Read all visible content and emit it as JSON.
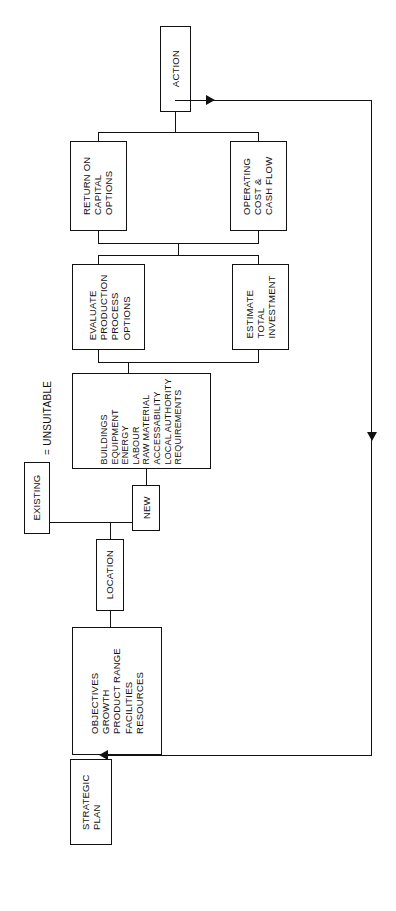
{
  "diagram": {
    "orientation": "rotated-90-ccw",
    "line_color": "#111111",
    "background": "#ffffff",
    "nodes": [
      {
        "id": "action",
        "label": "ACTION"
      },
      {
        "id": "return",
        "label": "RETURN ON\nCAPITAL\nOPTIONS"
      },
      {
        "id": "operating",
        "label": "OPERATING\nCOST &\nCASH FLOW"
      },
      {
        "id": "evaluate",
        "label": "EVALUATE\nPRODUCTION\nPROCESS\nOPTIONS"
      },
      {
        "id": "estimate",
        "label": "ESTIMATE\nTOTAL\nINVESTMENT"
      },
      {
        "id": "factors",
        "label": "BUILDINGS\nEQUIPMENT\nENERGY\nLABOUR\nRAW MATERIAL\nACCESSABILITY\nLOCAL AUTHORITY\nREQUIREMENTS"
      },
      {
        "id": "new",
        "label": "NEW"
      },
      {
        "id": "existing",
        "label": "EXISTING"
      },
      {
        "id": "location",
        "label": "LOCATION"
      },
      {
        "id": "objectives",
        "label": "OBJECTIVES\nGROWTH\nPRODUCT RANGE\nFACILITIES\nRESOURCES"
      },
      {
        "id": "strategic",
        "label": "STRATEGIC\nPLAN"
      }
    ],
    "legend": {
      "equals": "=",
      "text": "UNSUITABLE",
      "swatch_label": "EXISTING"
    },
    "labels": {
      "action": "ACTION",
      "return": "RETURN ON\nCAPITAL\nOPTIONS",
      "operating": "OPERATING\nCOST &\nCASH FLOW",
      "evaluate": "EVALUATE\nPRODUCTION\nPROCESS\nOPTIONS",
      "estimate": "ESTIMATE\nTOTAL\nINVESTMENT",
      "factors": "BUILDINGS\nEQUIPMENT\nENERGY\nLABOUR\nRAW MATERIAL\nACCESSABILITY\nLOCAL AUTHORITY\nREQUIREMENTS",
      "new": "NEW",
      "existing": "EXISTING",
      "location": "LOCATION",
      "objectives": "OBJECTIVES\nGROWTH\nPRODUCT RANGE\nFACILITIES\nRESOURCES",
      "strategic": "STRATEGIC\nPLAN",
      "legend_unsuitable": "= UNSUITABLE"
    }
  }
}
